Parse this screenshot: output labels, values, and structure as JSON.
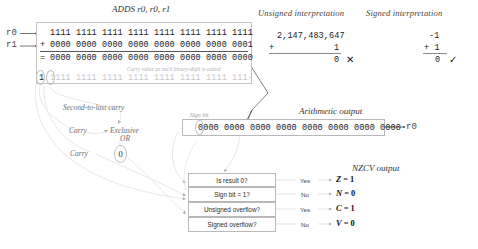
{
  "diagram": {
    "title": "ADDS r0, r0, r1",
    "column_headers": {
      "unsigned": "Unsigned interpretation",
      "signed": "Signed interpretation",
      "arithmetic_output": "Arithmetic output",
      "nzcv_output": "NZCV output"
    },
    "registers": {
      "operand1_label": "r0",
      "operand2_label": "r1",
      "result_label": "r0"
    },
    "binary": {
      "operand1": "1111 1111 1111 1111 1111 1111 1111 1111",
      "operand2": "0000 0000 0000 0000 0000 0000 0000 0001",
      "plus_sign": "+",
      "equals_sign": "=",
      "sum": "0000 0000 0000 0000 0000 0000 0000 0000",
      "carry_leading": "1",
      "carry_row": "1111 1111 1111 1111 1111 1111 1111 111-",
      "carry_caption": "Carry value as each binary-digit is added"
    },
    "unsigned_math": {
      "operand1": "2,147,483,647",
      "plus_sign": "+",
      "operand2": "1",
      "result": "0",
      "verdict_icon": "cross-icon",
      "verdict": "✕"
    },
    "signed_math": {
      "operand1": "-1",
      "operand2": "+ 1",
      "result": "0",
      "verdict_icon": "check-icon",
      "verdict": "✓"
    },
    "annotations": {
      "second_to_last_carry": "Second-to-last carry",
      "carry_upper": "Carry",
      "carry_lower": "Carry",
      "exclusive_or_line1": "Exclusive",
      "exclusive_or_line2": "OR",
      "xor_result": "0",
      "sign_bit": "Sign bit"
    },
    "output": {
      "bits": "0000 0000 0000 0000 0000 0000 0000 0000"
    },
    "flag_table": [
      {
        "question": "Is result 0?",
        "answer": "Yes",
        "flag": "Z",
        "equals": " = ",
        "value": "1"
      },
      {
        "question": "Sign bit = 1?",
        "answer": "No",
        "flag": "N",
        "equals": " = ",
        "value": "0"
      },
      {
        "question": "Unsigned overflow?",
        "answer": "Yes",
        "flag": "C",
        "equals": " = ",
        "value": "1"
      },
      {
        "question": "Signed overflow?",
        "answer": "No",
        "flag": "V",
        "equals": " = ",
        "value": "0"
      }
    ],
    "colors": {
      "text": "#1a1a1a",
      "faint": "#c9c9c9",
      "border": "#c0c0c0",
      "connector": "#d8d8d8"
    }
  }
}
